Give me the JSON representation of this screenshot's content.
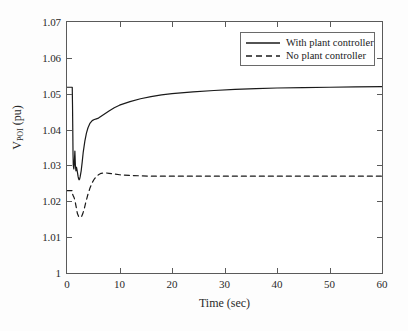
{
  "chart_data": {
    "type": "line",
    "title": "",
    "xlabel": "Time (sec)",
    "ylabel": "V_POI (pu)",
    "ylabel_main": "V",
    "ylabel_sub": "POI",
    "ylabel_units": " (pu)",
    "xlim": [
      0,
      60
    ],
    "ylim": [
      1,
      1.07
    ],
    "grid": false,
    "legend_position": "top-right",
    "xticks": [
      0,
      10,
      20,
      30,
      40,
      50,
      60
    ],
    "xtick_labels": [
      "0",
      "10",
      "20",
      "30",
      "40",
      "50",
      "60"
    ],
    "yticks": [
      1,
      1.01,
      1.02,
      1.03,
      1.04,
      1.05,
      1.06,
      1.07
    ],
    "ytick_labels": [
      "1",
      "1.01",
      "1.02",
      "1.03",
      "1.04",
      "1.05",
      "1.06",
      "1.07"
    ],
    "series": [
      {
        "name": "With plant controller",
        "style": "solid",
        "color": "#1a1a1a",
        "x": [
          0,
          0.3,
          0.6,
          0.9,
          1.0,
          1.05,
          1.1,
          1.15,
          1.2,
          1.3,
          1.4,
          1.5,
          1.6,
          1.7,
          1.8,
          1.9,
          2.0,
          2.1,
          2.2,
          2.3,
          2.4,
          2.5,
          2.7,
          2.9,
          3.1,
          3.4,
          3.7,
          4.0,
          4.4,
          4.8,
          5.2,
          5.6,
          6.0,
          6.5,
          7.0,
          8.0,
          9.0,
          10.0,
          12.0,
          14.0,
          16.0,
          18.0,
          20.0,
          24.0,
          28.0,
          32.0,
          36.0,
          40.0,
          45.0,
          50.0,
          55.0,
          60.0
        ],
        "y": [
          1.0518,
          1.0518,
          1.0518,
          1.0518,
          1.0518,
          1.047,
          1.04,
          1.033,
          1.03,
          1.029,
          1.031,
          1.034,
          1.03,
          1.0285,
          1.0295,
          1.0288,
          1.028,
          1.027,
          1.0263,
          1.026,
          1.0262,
          1.0268,
          1.0285,
          1.031,
          1.0338,
          1.0368,
          1.039,
          1.0405,
          1.0418,
          1.0425,
          1.0428,
          1.043,
          1.0432,
          1.0437,
          1.0442,
          1.0452,
          1.0461,
          1.0468,
          1.0478,
          1.0486,
          1.0492,
          1.0497,
          1.05,
          1.0505,
          1.0509,
          1.0512,
          1.0514,
          1.0516,
          1.0517,
          1.0518,
          1.0519,
          1.052
        ]
      },
      {
        "name": "No plant controller",
        "style": "dashed",
        "color": "#1a1a1a",
        "x": [
          0,
          0.3,
          0.6,
          0.9,
          1.0,
          1.05,
          1.1,
          1.2,
          1.3,
          1.4,
          1.5,
          1.6,
          1.7,
          1.8,
          1.9,
          2.0,
          2.2,
          2.4,
          2.6,
          2.8,
          3.0,
          3.3,
          3.6,
          4.0,
          4.4,
          4.8,
          5.2,
          5.6,
          6.0,
          6.5,
          7.0,
          7.5,
          8.0,
          9.0,
          10.0,
          12.0,
          14.0,
          16.0,
          20.0,
          25.0,
          30.0,
          35.0,
          40.0,
          45.0,
          50.0,
          55.0,
          60.0
        ],
        "y": [
          1.023,
          1.023,
          1.023,
          1.023,
          1.023,
          1.0222,
          1.0218,
          1.0215,
          1.0212,
          1.0208,
          1.0203,
          1.0196,
          1.0188,
          1.018,
          1.0172,
          1.0165,
          1.0158,
          1.0155,
          1.0155,
          1.0158,
          1.0165,
          1.018,
          1.0198,
          1.022,
          1.0238,
          1.0252,
          1.0262,
          1.0269,
          1.0274,
          1.0278,
          1.0279,
          1.0279,
          1.0278,
          1.0276,
          1.0274,
          1.0272,
          1.0271,
          1.027,
          1.027,
          1.027,
          1.027,
          1.027,
          1.027,
          1.027,
          1.027,
          1.027,
          1.027
        ]
      }
    ]
  },
  "legend": {
    "items": [
      {
        "label": "With plant controller",
        "style": "solid"
      },
      {
        "label": "No plant controller",
        "style": "dashed"
      }
    ]
  },
  "axes": {
    "x_title": "Time (sec)",
    "y_title_main": "V",
    "y_title_sub": "POI",
    "y_title_units": " (pu)"
  },
  "colors": {
    "line": "#1a1a1a",
    "axis": "#5a5a5a",
    "text": "#2a2a2a",
    "background": "#fdfdfd",
    "plot_background": "#ffffff"
  }
}
